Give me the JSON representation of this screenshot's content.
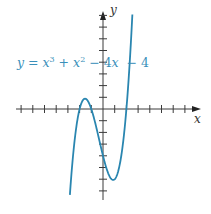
{
  "chart_data": {
    "type": "line",
    "title": "",
    "equation": "y = x³ + x² − 4x − 4",
    "xlabel": "x",
    "ylabel": "y",
    "xlim": [
      -7,
      8
    ],
    "ylim": [
      -7,
      8
    ],
    "x_ticks": [
      -7,
      -6,
      -5,
      -4,
      -3,
      -2,
      -1,
      1,
      2,
      3,
      4,
      5,
      6,
      7
    ],
    "y_ticks": [
      -7,
      -6,
      -5,
      -4,
      -3,
      -2,
      -1,
      1,
      2,
      3,
      4,
      5,
      6,
      7,
      8
    ],
    "tick_labels_shown": false,
    "grid": false,
    "series": [
      {
        "name": "y = x³ + x² − 4x − 4",
        "function": "x^3 + x^2 - 4x - 4",
        "domain": [
          -2.83,
          2.51
        ],
        "color": "#2a86b0",
        "key_points": {
          "roots": [
            [
              -2,
              0
            ],
            [
              -1,
              0
            ],
            [
              2,
              0
            ]
          ],
          "local_max": [
            -1.535,
            0.879
          ],
          "local_min": [
            0.869,
            -6.065
          ],
          "y_intercept": [
            0,
            -4
          ]
        }
      }
    ]
  },
  "labels": {
    "equation_parts": {
      "y": "y",
      "eq": " = ",
      "x1": "x",
      "sup3": "3",
      "plus": " + ",
      "x2": "x",
      "sup2": "2",
      "minus1": " − 4",
      "x3": "x",
      "minus2": "  − 4"
    },
    "x_axis": "x",
    "y_axis": "y"
  },
  "colors": {
    "curve": "#2a86b0",
    "axes": "#3a3a3a",
    "label": "#3a90ba"
  }
}
